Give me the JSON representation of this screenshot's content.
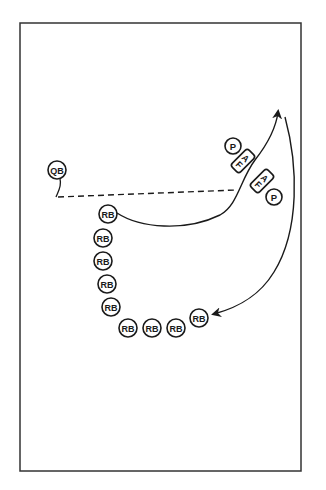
{
  "diagram": {
    "players": {
      "qb": {
        "label": "QB"
      },
      "passer_top": {
        "label": "P"
      },
      "passer_bottom": {
        "label": "P"
      },
      "bag_top": {
        "label_a": "A",
        "label_f": "F"
      },
      "bag_bottom": {
        "label_a": "A",
        "label_f": "F"
      },
      "running_backs": [
        {
          "label": "RB"
        },
        {
          "label": "RB"
        },
        {
          "label": "RB"
        },
        {
          "label": "RB"
        },
        {
          "label": "RB"
        },
        {
          "label": "RB"
        },
        {
          "label": "RB"
        },
        {
          "label": "RB"
        },
        {
          "label": "RB"
        }
      ]
    },
    "paths": {
      "pitch_line": "dashed",
      "rb_route": "solid-arrow",
      "return_route": "solid-arrow"
    },
    "colors": {
      "ink": "#1a1a1a",
      "field": "#ffffff",
      "border": "#333333"
    }
  }
}
